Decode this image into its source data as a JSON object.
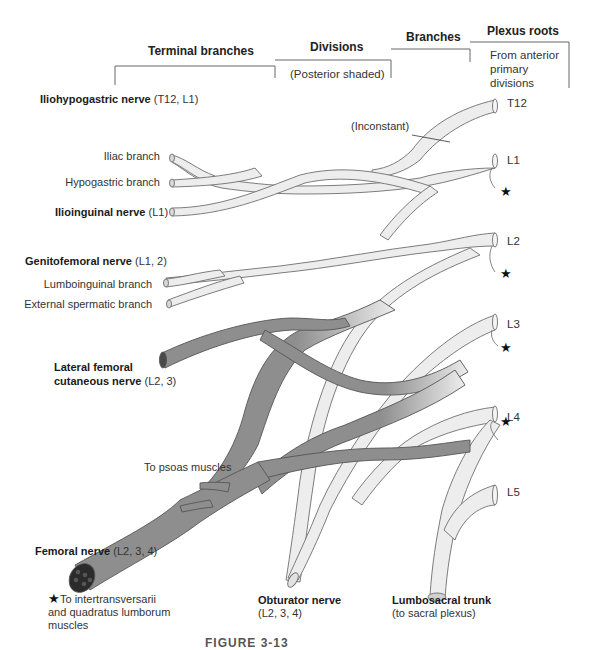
{
  "header": {
    "terminal_branches": "Terminal branches",
    "divisions": "Divisions",
    "divisions_note": "(Posterior shaded)",
    "branches": "Branches",
    "plexus_roots": "Plexus roots",
    "plexus_roots_note_1": "From anterior",
    "plexus_roots_note_2": "primary",
    "plexus_roots_note_3": "divisions"
  },
  "roots": [
    "T12",
    "L1",
    "L2",
    "L3",
    "L4",
    "L5"
  ],
  "annotations": {
    "inconstant": "(Inconstant)",
    "star": "★"
  },
  "nerves": {
    "iliohypogastric": {
      "name": "Iliohypogastric nerve",
      "roots": " (T12, L1)"
    },
    "iliac_branch": "Iliac branch",
    "hypogastric_branch": "Hypogastric branch",
    "ilioinguinal": {
      "name": "Ilioinguinal nerve",
      "roots": " (L1)"
    },
    "genitofemoral": {
      "name": "Genitofemoral nerve",
      "roots": " (L1, 2)"
    },
    "lumboinguinal_branch": "Lumboinguinal branch",
    "external_spermatic_branch": "External spermatic branch",
    "lateral_femoral_cutaneous": {
      "name_1": "Lateral femoral",
      "name_2": "cutaneous nerve",
      "roots": " (L2, 3)"
    },
    "to_psoas": "To psoas muscles",
    "femoral": {
      "name": "Femoral nerve",
      "roots": " (L2, 3, 4)"
    },
    "obturator": {
      "name": "Obturator nerve",
      "roots": "(L2, 3, 4)"
    },
    "lumbosacral_trunk": {
      "name": "Lumbosacral trunk",
      "note": "(to sacral plexus)"
    }
  },
  "footnote": {
    "star": "★",
    "line_1": "To intertransversarii",
    "line_2": "and quadratus lumborum",
    "line_3": "muscles"
  },
  "caption": "FIGURE 3-13",
  "colors": {
    "anterior_fill": "#ededed",
    "posterior_fill": "#8e8e8e",
    "outline": "#6e6e6e",
    "bracket": "#666666"
  }
}
